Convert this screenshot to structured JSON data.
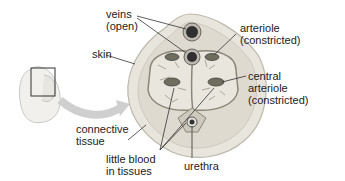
{
  "labels": {
    "veins": [
      "veins",
      "(open)"
    ],
    "skin": "skin",
    "arteriole": [
      "arteriole",
      "(constricted)"
    ],
    "central_arteriole": [
      "central",
      "arteriole",
      "(constricted)"
    ],
    "connective_tissue": [
      "connective",
      "tissue"
    ],
    "little_blood": [
      "little blood",
      "in tissues"
    ],
    "urethra": "urethra"
  },
  "colors": {
    "outer": "#e6e3da",
    "tissue": "#d2cec2",
    "spongy": "#e4e1d8",
    "vessel": "#7a7a6c",
    "dark": "#333333"
  }
}
